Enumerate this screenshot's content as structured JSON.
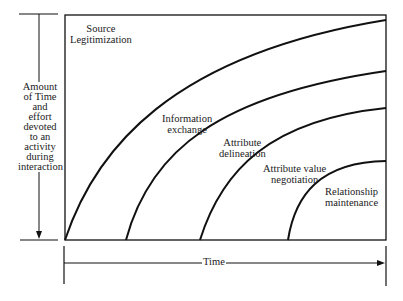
{
  "diagram": {
    "type": "conceptual overlapping-curves diagram",
    "y_axis": {
      "label_lines": [
        "Amount",
        "of Time",
        "and",
        "effort",
        "devoted",
        "to an",
        "activity",
        "during",
        "interaction"
      ]
    },
    "x_axis": {
      "label": "Time"
    },
    "curves": [
      {
        "label_lines": [
          "Source",
          "Legitimization"
        ],
        "start_x": 65,
        "end_y": 20
      },
      {
        "label_lines": [
          "Information",
          "exchange"
        ],
        "start_x": 126,
        "end_y": 71
      },
      {
        "label_lines": [
          "Attribute",
          "delineation"
        ],
        "start_x": 200,
        "end_y": 108
      },
      {
        "label_lines": [
          "Attribute value",
          "negotiation"
        ],
        "start_x": 288,
        "end_y": 161
      },
      {
        "label_lines": [
          "Relationship",
          "maintenance"
        ],
        "start_x": 288,
        "end_y": 161
      }
    ],
    "stroke_color": "#111111",
    "background": "#ffffff"
  },
  "labels": {
    "source": [
      "Source",
      "Legitimization"
    ],
    "info": [
      "Information",
      "exchange"
    ],
    "attr_del": [
      "Attribute",
      "delineation"
    ],
    "attr_val": [
      "Attribute value",
      "negotiation"
    ],
    "relationship": [
      "Relationship",
      "maintenance"
    ],
    "time": "Time",
    "y": [
      "Amount",
      "of Time",
      "and",
      "effort",
      "devoted",
      "to an",
      "activity",
      "during",
      "interaction"
    ]
  }
}
